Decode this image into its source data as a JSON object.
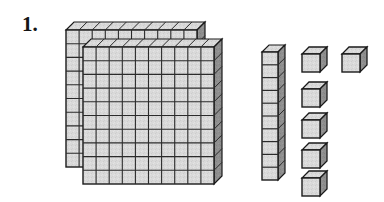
{
  "page": {
    "background_color": "#ffffff",
    "width": 384,
    "height": 202
  },
  "problem": {
    "number_label": "1.",
    "kind": "base-ten-blocks"
  },
  "colors": {
    "face_top": "#d9d9d9",
    "face_front": "#d4d4d4",
    "face_side": "#8f8f8f",
    "outline": "#1a1a1a",
    "grid_line": "#2b2b2b",
    "label": "#151515"
  },
  "groups": [
    {
      "name": "hundreds-flats",
      "label": "hundreds",
      "place_value": 100,
      "count": 2,
      "rows": 10,
      "cols": 10,
      "cubes_each": 100,
      "total_cubes": 200
    },
    {
      "name": "tens-rod",
      "label": "tens",
      "place_value": 10,
      "count": 1,
      "rows": 10,
      "cols": 1,
      "cubes_each": 10,
      "total_cubes": 10
    },
    {
      "name": "ones-cubes",
      "label": "ones",
      "place_value": 1,
      "count": 6,
      "rows": 1,
      "cols": 1,
      "cubes_each": 1,
      "total_cubes": 6
    }
  ],
  "represented_value": {
    "hundreds": 2,
    "tens": 1,
    "ones": 6,
    "total": 216
  },
  "geometry": {
    "cell": 13.1,
    "depth_x": 8,
    "depth_y": -8,
    "flat_back_origin": [
      66,
      30
    ],
    "flat_front_origin": [
      83,
      47
    ],
    "rod_origin": [
      262,
      52
    ],
    "ones_positions": [
      [
        302,
        48
      ],
      [
        342,
        48
      ],
      [
        302,
        84
      ],
      [
        302,
        117
      ],
      [
        302,
        148
      ],
      [
        302,
        176
      ]
    ],
    "ones_size": 20
  }
}
